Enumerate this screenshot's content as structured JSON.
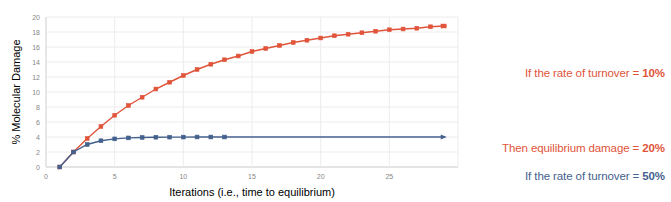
{
  "chart_data": {
    "type": "line",
    "title": "",
    "xlabel": "Iterations (i.e., time to equilibrium)",
    "ylabel": "% Molecular Damage",
    "xlim": [
      0,
      30
    ],
    "ylim": [
      0,
      20
    ],
    "xticks": [
      "0",
      "5",
      "10",
      "15",
      "20",
      "25"
    ],
    "xtick_values": [
      0,
      5,
      10,
      15,
      20,
      25
    ],
    "yticks": [
      "0",
      "2",
      "4",
      "6",
      "8",
      "10",
      "12",
      "14",
      "16",
      "18",
      "20"
    ],
    "ytick_values": [
      0,
      2,
      4,
      6,
      8,
      10,
      12,
      14,
      16,
      18,
      20
    ],
    "grid": true,
    "legend": "none",
    "series": [
      {
        "name": "turnover-10-percent",
        "color": "#E0543A",
        "marker": "square",
        "x": [
          1,
          2,
          3,
          4,
          5,
          6,
          7,
          8,
          9,
          10,
          11,
          12,
          13,
          14,
          15,
          16,
          17,
          18,
          19,
          20,
          21,
          22,
          23,
          24,
          25,
          26,
          27,
          28,
          29
        ],
        "y": [
          0.0,
          2.0,
          3.8,
          5.4,
          6.9,
          8.2,
          9.3,
          10.4,
          11.3,
          12.2,
          13.0,
          13.7,
          14.3,
          14.8,
          15.4,
          15.8,
          16.2,
          16.6,
          16.9,
          17.2,
          17.5,
          17.7,
          17.9,
          18.1,
          18.3,
          18.4,
          18.5,
          18.7,
          18.8
        ],
        "arrow_end": true
      },
      {
        "name": "turnover-50-percent",
        "color": "#44618E",
        "marker": "square",
        "x": [
          1,
          2,
          3,
          4,
          5,
          6,
          7,
          8,
          9,
          10,
          11,
          12,
          13
        ],
        "y": [
          0.0,
          2.0,
          3.0,
          3.5,
          3.75,
          3.88,
          3.94,
          3.97,
          3.98,
          3.99,
          4.0,
          4.0,
          4.0
        ],
        "tail_to_x": 29,
        "arrow_end": true
      }
    ],
    "annotations": [
      {
        "name": "annotation-red",
        "color": "#E0543A",
        "lines": [
          {
            "text": "If the rate of turnover = ",
            "value": "10%"
          },
          {
            "text": "Then equilibrium damage = ",
            "value": "20%"
          }
        ]
      },
      {
        "name": "annotation-blue",
        "color": "#44618E",
        "lines": [
          {
            "text": "If the rate of turnover = ",
            "value": "50%"
          },
          {
            "text": "Then equilibrium damage = ",
            "value": " 4%"
          }
        ]
      }
    ]
  }
}
